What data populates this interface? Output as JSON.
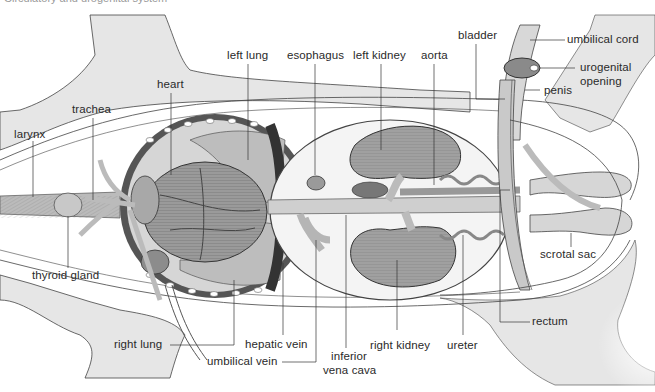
{
  "diagram": {
    "caption": "Circulatory and urogenital system",
    "colors": {
      "skin": "#e6e6e6",
      "organ": "#a8a8a8",
      "organ_dark": "#6e6e6e",
      "vessel": "#c9c9c9",
      "line": "#3a3a3a",
      "label": "#2a2a2a"
    },
    "labels": {
      "larynx": "larynx",
      "trachea": "trachea",
      "heart": "heart",
      "left_lung": "left lung",
      "esophagus": "esophagus",
      "left_kidney": "left kidney",
      "aorta": "aorta",
      "bladder": "bladder",
      "umbilical_cord": "umbilical cord",
      "urogenital_opening_1": "urogenital",
      "urogenital_opening_2": "opening",
      "penis": "penis",
      "thyroid_gland": "thyroid gland",
      "scrotal_sac": "scrotal sac",
      "right_lung": "right lung",
      "hepatic_vein": "hepatic vein",
      "umbilical_vein": "umbilical vein",
      "inferior_vena_cava_1": "inferior",
      "inferior_vena_cava_2": "vena cava",
      "right_kidney": "right kidney",
      "ureter": "ureter",
      "rectum": "rectum"
    }
  }
}
